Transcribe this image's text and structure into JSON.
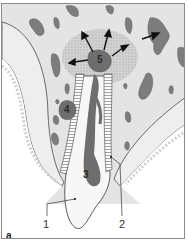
{
  "figure": {
    "panel_label": "a",
    "labels": {
      "l1": "1",
      "l2": "2",
      "l3": "3",
      "l4": "4",
      "l5": "5"
    },
    "colors": {
      "bone": "#e4e4e4",
      "lesion_halo": "#c9c9c9",
      "marrow": "#7d7d7d",
      "pulp": "#6e6e6e",
      "tooth": "#f7f7f7",
      "gingiva": "#e9e9e9",
      "outline": "#4a4a4a",
      "frame": "#8a8a8a"
    }
  }
}
